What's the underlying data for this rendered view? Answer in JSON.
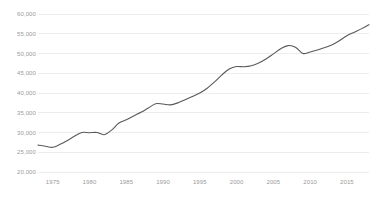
{
  "chart_data": {
    "type": "line",
    "title": "",
    "subtitle": "",
    "xlabel": "",
    "ylabel": "",
    "xlim": [
      1973,
      2018
    ],
    "ylim": [
      20000,
      60000
    ],
    "grid": true,
    "legend": false,
    "legend_position": "none",
    "line_color": "#595959",
    "grid_color": "#ededed",
    "tick_label_color": "#9a9a9a",
    "background_color": "#ffffff",
    "ytick_labels": [
      "60,000",
      "55,000",
      "50,000",
      "45,000",
      "40,000",
      "35,000",
      "30,000",
      "25,000",
      "20,000"
    ],
    "ytick_values": [
      60000,
      55000,
      50000,
      45000,
      40000,
      35000,
      30000,
      25000,
      20000
    ],
    "xtick_labels": [
      "1975",
      "1980",
      "1985",
      "1990",
      "1995",
      "2000",
      "2005",
      "2010",
      "2015"
    ],
    "xtick_values": [
      1975,
      1980,
      1985,
      1990,
      1995,
      2000,
      2005,
      2010,
      2015
    ],
    "x": [
      1973,
      1974,
      1975,
      1976,
      1977,
      1978,
      1979,
      1980,
      1981,
      1982,
      1983,
      1984,
      1985,
      1986,
      1987,
      1988,
      1989,
      1990,
      1991,
      1992,
      1993,
      1994,
      1995,
      1996,
      1997,
      1998,
      1999,
      2000,
      2001,
      2002,
      2003,
      2004,
      2005,
      2006,
      2007,
      2008,
      2009,
      2010,
      2011,
      2012,
      2013,
      2014,
      2015,
      2016,
      2017,
      2018
    ],
    "values": [
      26800,
      26500,
      26250,
      27000,
      28000,
      29100,
      30000,
      29950,
      30000,
      29450,
      30600,
      32400,
      33200,
      34200,
      35100,
      36200,
      37300,
      37200,
      37000,
      37500,
      38300,
      39100,
      40000,
      41200,
      42800,
      44600,
      46100,
      46700,
      46650,
      46900,
      47600,
      48600,
      49900,
      51200,
      52000,
      51600,
      50000,
      50400,
      50900,
      51500,
      52200,
      53300,
      54500,
      55400,
      56300,
      57300
    ],
    "series": [
      {
        "name": "value",
        "values": [
          26800,
          26500,
          26250,
          27000,
          28000,
          29100,
          30000,
          29950,
          30000,
          29450,
          30600,
          32400,
          33200,
          34200,
          35100,
          36200,
          37300,
          37200,
          37000,
          37500,
          38300,
          39100,
          40000,
          41200,
          42800,
          44600,
          46100,
          46700,
          46650,
          46900,
          47600,
          48600,
          49900,
          51200,
          52000,
          51600,
          50000,
          50400,
          50900,
          51500,
          52200,
          53300,
          54500,
          55400,
          56300,
          57300
        ]
      }
    ]
  }
}
